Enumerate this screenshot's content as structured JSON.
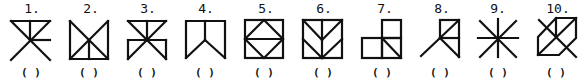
{
  "figures": [
    {
      "number": "1.",
      "answer": "( )"
    },
    {
      "number": "2.",
      "answer": "( )"
    },
    {
      "number": "3.",
      "answer": "( )"
    },
    {
      "number": "4.",
      "answer": "( )"
    },
    {
      "number": "5.",
      "answer": "( )"
    },
    {
      "number": "6.",
      "answer": "( )"
    },
    {
      "number": "7.",
      "answer": "( )"
    },
    {
      "number": "8.",
      "answer": "( )"
    },
    {
      "number": "9.",
      "answer": "( )"
    },
    {
      "number": "10.",
      "answer": "( )"
    }
  ]
}
